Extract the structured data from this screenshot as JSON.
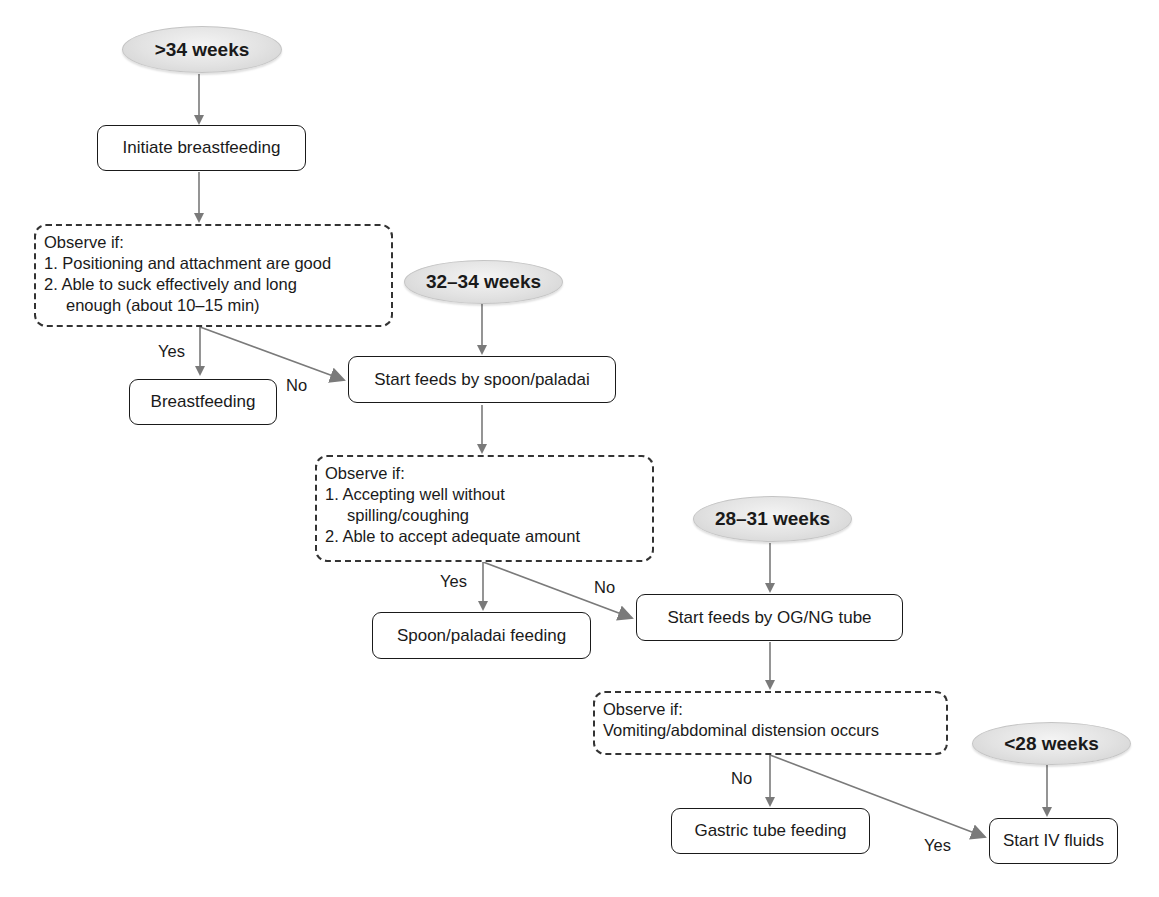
{
  "diagram": {
    "type": "flowchart",
    "colors": {
      "arrow": "#7a7a7a",
      "box_border": "#1a1a1a",
      "ellipse_fill": "#e2e2e2",
      "text": "#1a1a1a"
    },
    "gestation_groups": {
      "over_34": ">34 weeks",
      "w32_34": "32–34 weeks",
      "w28_31": "28–31 weeks",
      "under_28": "<28 weeks"
    },
    "steps": {
      "initiate_breastfeeding": "Initiate breastfeeding",
      "breastfeeding": "Breastfeeding",
      "start_spoon": "Start feeds by spoon/paladai",
      "spoon_feeding": "Spoon/paladai feeding",
      "start_ogng": "Start feeds by OG/NG tube",
      "gastric_feeding": "Gastric tube feeding",
      "start_iv": "Start IV fluids"
    },
    "observe_1": {
      "title": "Observe if:",
      "line1": "1. Positioning and attachment are good",
      "line2": "2. Able to suck effectively and long",
      "line3": "enough (about 10–15 min)"
    },
    "observe_2": {
      "title": "Observe if:",
      "line1": "1. Accepting well without",
      "line2": "spilling/coughing",
      "line3": "2. Able to accept adequate amount"
    },
    "observe_3": {
      "title": "Observe if:",
      "line1": "Vomiting/abdominal distension occurs"
    },
    "edge_labels": {
      "obs1_yes": "Yes",
      "obs1_no": "No",
      "obs2_yes": "Yes",
      "obs2_no": "No",
      "obs3_no": "No",
      "obs3_yes": "Yes"
    }
  }
}
